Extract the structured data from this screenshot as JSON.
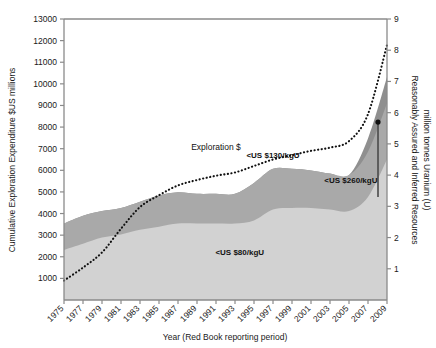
{
  "chart_data": {
    "type": "area",
    "title": "",
    "xlabel": "Year (Red Book reporting period)",
    "ylabel": "Cumulative Exploration Expenditure $US millions",
    "y2label": "Reasonably Assured and Inferred Resources million tonnes Uranium (U)",
    "grid": false,
    "legend": "none",
    "xlim": [
      1975,
      2009
    ],
    "ylim": [
      0,
      13000
    ],
    "y2lim": [
      0,
      9
    ],
    "yticks": [
      1000,
      2000,
      3000,
      4000,
      5000,
      6000,
      7000,
      8000,
      9000,
      10000,
      11000,
      12000,
      13000
    ],
    "y2ticks": [
      1,
      2,
      3,
      4,
      5,
      6,
      7,
      8,
      9
    ],
    "xticks": [
      "1975",
      "1977",
      "1979",
      "1981",
      "1983",
      "1985",
      "1987",
      "1989",
      "1991",
      "1993",
      "1995",
      "1997",
      "1999",
      "2001",
      "2003",
      "2005",
      "2007",
      "2009"
    ],
    "x": [
      1975,
      1977,
      1979,
      1981,
      1983,
      1985,
      1987,
      1989,
      1991,
      1993,
      1995,
      1997,
      1999,
      2001,
      2003,
      2005,
      2007,
      2009
    ],
    "series": [
      {
        "name": "<US $80/kgU",
        "axis": "right",
        "units": "million tonnes U",
        "values": [
          1.6,
          1.8,
          2.0,
          2.1,
          2.25,
          2.35,
          2.45,
          2.45,
          2.45,
          2.45,
          2.55,
          2.9,
          2.95,
          2.95,
          2.9,
          2.85,
          3.3,
          4.5
        ]
      },
      {
        "name": "<US $130/kgU",
        "axis": "right",
        "units": "million tonnes U",
        "values": [
          2.45,
          2.7,
          2.85,
          2.95,
          3.15,
          3.35,
          3.45,
          3.4,
          3.4,
          3.4,
          3.75,
          4.2,
          4.2,
          4.15,
          4.05,
          4.0,
          4.75,
          6.3
        ]
      },
      {
        "name": "<US $260/kgU",
        "axis": "right",
        "units": "million tonnes U",
        "values": [
          2.45,
          2.7,
          2.85,
          2.95,
          3.15,
          3.35,
          3.45,
          3.4,
          3.4,
          3.4,
          3.75,
          4.2,
          4.2,
          4.15,
          4.05,
          4.0,
          4.75,
          6.3
        ]
      },
      {
        "name": "Exploration $",
        "axis": "left",
        "units": "$US millions",
        "style": "dotted",
        "values": [
          900,
          1500,
          2200,
          3300,
          4300,
          4850,
          5300,
          5550,
          5750,
          5900,
          6200,
          6500,
          6700,
          6900,
          7050,
          7350,
          8600,
          11800
        ]
      }
    ],
    "annotations": [
      {
        "text": "Exploration $",
        "x": 1991,
        "y_left": 6950
      },
      {
        "text": "<US $130/kgU",
        "x": 1997,
        "y_right": 4.55
      },
      {
        "text": "<US $260/kgU",
        "x": 2005.2,
        "y_right": 3.75
      },
      {
        "text": "<US $80/kgU",
        "x": 1993.5,
        "y_right": 1.45
      }
    ],
    "marker": {
      "name": "resource-range-bar",
      "x": 2009,
      "y_right_top": 5.7,
      "y_right_bottom": 3.3
    },
    "colors": {
      "band_low": "#d2d2d2",
      "band_mid": "#a9a9a9",
      "band_high": "#8f8f8f",
      "line": "#111111",
      "axis": "#8a8a8a",
      "text": "#1a1a1a"
    }
  }
}
